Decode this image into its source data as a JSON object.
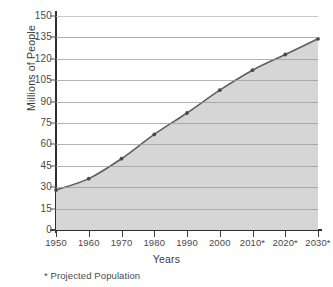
{
  "chart_data": {
    "type": "area",
    "title": "",
    "xlabel": "Years",
    "ylabel": "Millions of People",
    "x": [
      1950,
      1960,
      1970,
      1980,
      1990,
      2000,
      2010,
      2020,
      2030
    ],
    "categories": [
      "1950",
      "1960",
      "1970",
      "1980",
      "1990",
      "2000",
      "2010*",
      "2020*",
      "2030*"
    ],
    "values": [
      28,
      36,
      50,
      67,
      82,
      98,
      112,
      123,
      134
    ],
    "series": [
      {
        "name": "Population",
        "values": [
          28,
          36,
          50,
          67,
          82,
          98,
          112,
          123,
          134
        ]
      }
    ],
    "ylim": [
      0,
      150
    ],
    "yticks": [
      0,
      15,
      30,
      45,
      60,
      75,
      90,
      105,
      120,
      135,
      150
    ],
    "ytick_labels": [
      "0",
      "15",
      "30",
      "45",
      "60",
      "75",
      "90",
      "105",
      "120",
      "135",
      "150"
    ],
    "grid": true,
    "legend": "none",
    "annotations": [
      "* Projected Population"
    ],
    "colors": {
      "line": "#5f5f5f",
      "fill": "#d6d6d6",
      "grid": "#9a9a9a",
      "axis": "#2f2f2f",
      "marker": "#4a4a4a",
      "text": "#3b3b3b",
      "background": "#ffffff"
    }
  },
  "footnote": "* Projected Population",
  "axis_titles": {
    "y": "Millions of People",
    "x": "Years"
  }
}
